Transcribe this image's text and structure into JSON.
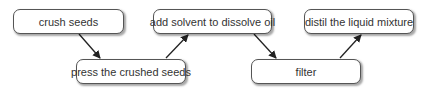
{
  "diagram": {
    "type": "flowchart",
    "nodes": [
      {
        "id": "n1",
        "label": "crush seeds",
        "x": 13,
        "y": 9,
        "w": 111,
        "h": 25
      },
      {
        "id": "n2",
        "label": "press the crushed seeds",
        "x": 76,
        "y": 59,
        "w": 110,
        "h": 25
      },
      {
        "id": "n3",
        "label": "add solvent to dissolve oil",
        "x": 153,
        "y": 9,
        "w": 119,
        "h": 25
      },
      {
        "id": "n4",
        "label": "filter",
        "x": 251,
        "y": 59,
        "w": 110,
        "h": 25
      },
      {
        "id": "n5",
        "label": "distil the liquid mixture",
        "x": 304,
        "y": 9,
        "w": 110,
        "h": 25
      }
    ],
    "edges": [
      {
        "from": "n1",
        "to": "n2"
      },
      {
        "from": "n2",
        "to": "n3"
      },
      {
        "from": "n3",
        "to": "n4"
      },
      {
        "from": "n4",
        "to": "n5"
      }
    ]
  }
}
